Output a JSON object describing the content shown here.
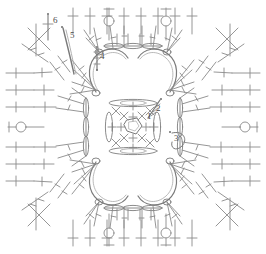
{
  "diagram": {
    "type": "crochet-pattern-chart",
    "colors": {
      "background": "#ffffff",
      "stroke": "#8a8a8a",
      "stroke_light": "#a8a8a8",
      "stroke_dark": "#6e6e6e",
      "label_text": "#4a4a4a"
    },
    "round_labels": [
      {
        "id": "label-1",
        "text": "1",
        "x": 147,
        "y": 117,
        "round": 1
      },
      {
        "id": "label-2",
        "text": "2",
        "x": 156,
        "y": 109,
        "round": 2
      },
      {
        "id": "label-3",
        "text": "3",
        "x": 174,
        "y": 139,
        "round": 3
      },
      {
        "id": "label-4",
        "text": "4",
        "x": 100,
        "y": 57,
        "round": 4
      },
      {
        "id": "label-5",
        "text": "5",
        "x": 70,
        "y": 36,
        "round": 5
      },
      {
        "id": "label-6",
        "text": "6",
        "x": 53,
        "y": 21,
        "round": 6
      }
    ],
    "symbols": {
      "chain": "chain-stitch-oval",
      "single_crochet": "single-crochet-cross",
      "double_crochet": "double-crochet-bar",
      "picot_ring": "picot-ring-loop",
      "crossed_stitch": "crossed-stitch-x",
      "center_ring": "magic-ring"
    },
    "structure": {
      "center_ring": {
        "cx": 133,
        "cy": 127,
        "r": 12
      },
      "petals": 4,
      "rounds": 6,
      "radiating_spokes_per_side": 9,
      "corner_crossed_groups": 4
    }
  }
}
